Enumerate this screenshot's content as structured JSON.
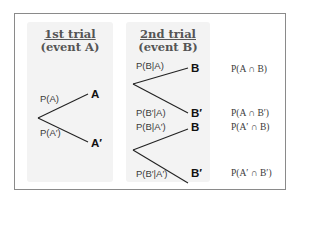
{
  "diagram": {
    "type": "probability-tree",
    "stage1": {
      "title": "1st trial",
      "subtitle": "(event A)"
    },
    "stage2": {
      "title": "2nd trial",
      "subtitle": "(event B)"
    },
    "first_branches": [
      {
        "prob": "P(A)",
        "outcome": "A"
      },
      {
        "prob": "P(A′)",
        "outcome": "A′"
      }
    ],
    "second_branches": [
      {
        "prob": "P(B|A)",
        "outcome": "B",
        "joint": "P(A ∩ B)"
      },
      {
        "prob": "P(B′|A)",
        "outcome": "B′",
        "joint": "P(A ∩ B′)"
      },
      {
        "prob": "P(B|A′)",
        "outcome": "B",
        "joint": "P(A′ ∩ B)"
      },
      {
        "prob": "P(B′|A′)",
        "outcome": "B′",
        "joint": "P(A′ ∩ B′)"
      }
    ],
    "colors": {
      "border": "#8a8a8a",
      "panel": "#f3f3f3",
      "line": "#222222"
    }
  }
}
